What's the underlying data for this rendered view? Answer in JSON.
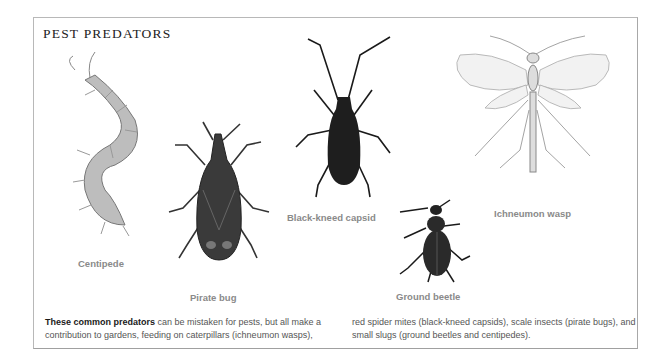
{
  "title": "PEST PREDATORS",
  "illustrations": [
    {
      "name": "Centipede",
      "label": "Centipede"
    },
    {
      "name": "Pirate bug",
      "label": "Pirate bug"
    },
    {
      "name": "Black-kneed capsid",
      "label": "Black-kneed capsid"
    },
    {
      "name": "Ground beetle",
      "label": "Ground beetle"
    },
    {
      "name": "Ichneumon wasp",
      "label": "Ichneumon wasp"
    }
  ],
  "caption": {
    "bold_lead": "These common predators",
    "col1_rest": " can be mistaken for pests, but all make a contribution to gardens, feeding on caterpillars (ichneumon wasps),",
    "col2": "red spider mites (black-kneed capsids), scale insects (pirate bugs), and small slugs (ground beetles and centipedes)."
  },
  "colors": {
    "frame": "#b8b8b8",
    "label": "#8a8a8a",
    "text": "#555555"
  }
}
